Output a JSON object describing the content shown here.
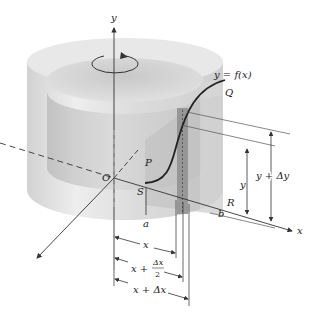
{
  "figure": {
    "colors": {
      "background": "#ffffff",
      "solid_light": "#e6e6e6",
      "solid_mid": "#cfcfcf",
      "solid_dark": "#a9a9a9",
      "strip": "#8c8c8c",
      "line": "#333333"
    },
    "axes": {
      "y_label": "y",
      "x_label": "x",
      "origin_label": "O"
    },
    "curve": {
      "label": "y = f(x)",
      "start_point": "P",
      "end_point": "Q"
    },
    "region_points": {
      "S": "S",
      "R": "R"
    },
    "bounds": {
      "a": "a",
      "b": "b"
    },
    "dimensions": {
      "x": "x",
      "x_half": {
        "prefix": "x +",
        "num": "Δx",
        "den": "2"
      },
      "x_plus_dx": "x + Δx",
      "y": "y",
      "y_plus_dy": "y + Δy"
    },
    "icons": [
      "rotation-arrow-icon",
      "axis-arrow-icon"
    ]
  }
}
